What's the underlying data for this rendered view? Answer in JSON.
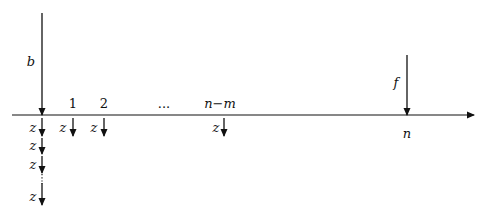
{
  "diagram": {
    "axis": {
      "y": 115,
      "x_start": 12,
      "x_end": 474
    },
    "top_arrows": [
      {
        "id": "b",
        "label": "b",
        "x": 42,
        "y_top": 13,
        "y_bottom": 115,
        "label_x": 31,
        "label_y": 66
      },
      {
        "id": "f",
        "label": "f",
        "x": 407,
        "y_top": 55,
        "y_bottom": 115,
        "label_x": 396,
        "label_y": 87
      }
    ],
    "tick_labels": [
      {
        "text": "1",
        "x": 73,
        "y": 108,
        "italic": false
      },
      {
        "text": "2",
        "x": 104,
        "y": 108,
        "italic": false
      },
      {
        "text": "...",
        "x": 164,
        "y": 108,
        "italic": false
      },
      {
        "text": "n−m",
        "x": 220,
        "y": 108,
        "italic": true
      },
      {
        "text": "n",
        "x": 407,
        "y": 138,
        "italic": true
      }
    ],
    "z_arrows": [
      {
        "label": "z",
        "x": 42,
        "y_top": 118,
        "y_bottom": 136,
        "label_x": 33,
        "label_y": 132
      },
      {
        "label": "z",
        "x": 73,
        "y_top": 118,
        "y_bottom": 136,
        "label_x": 63,
        "label_y": 132
      },
      {
        "label": "z",
        "x": 104,
        "y_top": 118,
        "y_bottom": 136,
        "label_x": 94,
        "label_y": 132
      },
      {
        "label": "z",
        "x": 224,
        "y_top": 118,
        "y_bottom": 136,
        "label_x": 216,
        "label_y": 132
      },
      {
        "label": "z",
        "x": 42,
        "y_top": 138,
        "y_bottom": 154,
        "label_x": 33,
        "label_y": 150
      },
      {
        "label": "z",
        "x": 42,
        "y_top": 156,
        "y_bottom": 173,
        "label_x": 33,
        "label_y": 169
      },
      {
        "label": "z",
        "x": 42,
        "y_top": 183,
        "y_bottom": 205,
        "label_x": 33,
        "label_y": 201
      }
    ],
    "dotted_segment": {
      "x": 42,
      "y_top": 174,
      "y_bottom": 184
    }
  }
}
